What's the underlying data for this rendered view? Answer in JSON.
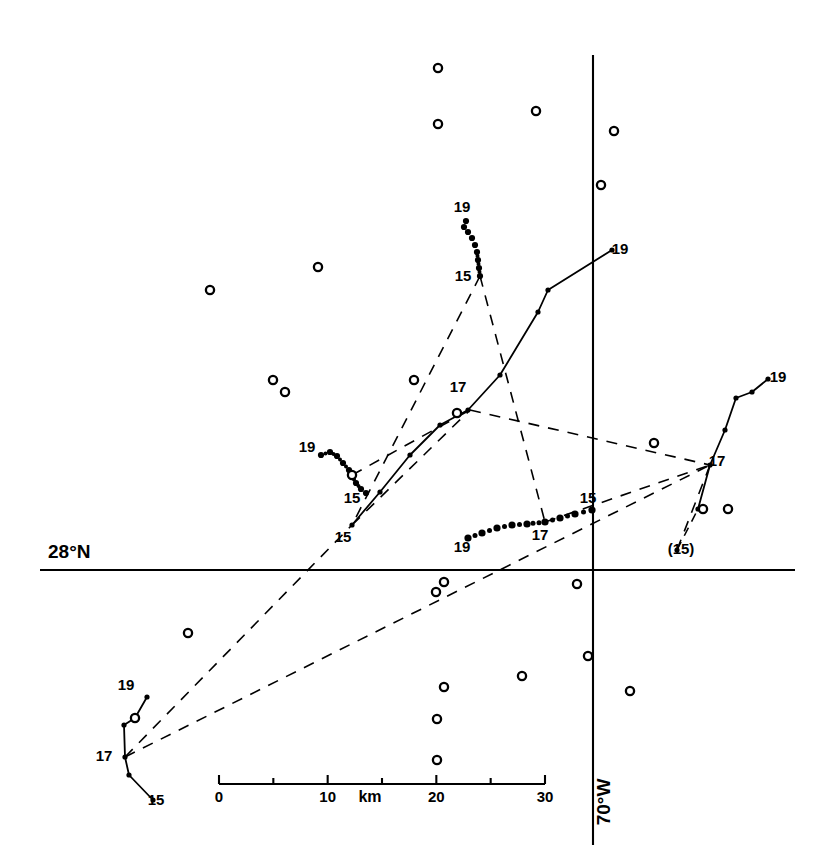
{
  "figure": {
    "type": "map",
    "background_color": "#ffffff",
    "ink_color": "#000000"
  },
  "axes": {
    "latitude_label": "28°N",
    "longitude_label": "70°W",
    "horizontal_axis": {
      "y_px": 570,
      "x_start_px": 40,
      "x_end_px": 795
    },
    "vertical_axis": {
      "x_px": 593,
      "y_start_px": 55,
      "y_end_px": 845
    }
  },
  "scalebar": {
    "unit_label": "km",
    "tick_labels": [
      "0",
      "10",
      "20",
      "30"
    ],
    "tick_values": [
      0,
      5,
      10,
      15,
      20,
      25,
      30
    ],
    "major_ticks": [
      0,
      10,
      20,
      30
    ],
    "x_start_px": 219,
    "x_end_px": 545,
    "y_px": 784,
    "km_per_px": 0.092
  },
  "chart_data": {
    "type": "scatter",
    "title": "",
    "xlabel": "km",
    "ylabel": "",
    "grid": false,
    "legend": "none",
    "station_markers": {
      "symbol": "open-circle",
      "count": 24,
      "points_px": [
        [
          438,
          68
        ],
        [
          438,
          124
        ],
        [
          536,
          111
        ],
        [
          614,
          131
        ],
        [
          601,
          185
        ],
        [
          318,
          267
        ],
        [
          210,
          290
        ],
        [
          273,
          380
        ],
        [
          285,
          392
        ],
        [
          414,
          380
        ],
        [
          457,
          413
        ],
        [
          352,
          475
        ],
        [
          135,
          718
        ],
        [
          188,
          633
        ],
        [
          444,
          582
        ],
        [
          436,
          592
        ],
        [
          654,
          443
        ],
        [
          577,
          584
        ],
        [
          444,
          687
        ],
        [
          437,
          719
        ],
        [
          437,
          760
        ],
        [
          588,
          656
        ],
        [
          522,
          676
        ],
        [
          630,
          691
        ],
        [
          703,
          509
        ],
        [
          728,
          509
        ]
      ]
    },
    "tracks": [
      {
        "id": "track-top-center",
        "style": "dotted",
        "start_label": "15",
        "end_label": "19",
        "labels": [
          {
            "text": "19",
            "x": 462,
            "y": 212
          },
          {
            "text": "15",
            "x": 463,
            "y": 281
          }
        ],
        "points_px": [
          [
            480,
            276
          ],
          [
            479,
            268
          ],
          [
            478,
            260
          ],
          [
            477,
            252
          ],
          [
            475,
            245
          ],
          [
            472,
            238
          ],
          [
            468,
            232
          ],
          [
            464,
            227
          ],
          [
            466,
            221
          ]
        ]
      },
      {
        "id": "track-left-small",
        "style": "dotted",
        "start_label": "19",
        "end_label": "15",
        "labels": [
          {
            "text": "19",
            "x": 307,
            "y": 452
          },
          {
            "text": "15",
            "x": 352,
            "y": 503
          }
        ],
        "points_px": [
          [
            321,
            455
          ],
          [
            330,
            452
          ],
          [
            337,
            456
          ],
          [
            343,
            463
          ],
          [
            349,
            470
          ],
          [
            352,
            476
          ],
          [
            356,
            483
          ],
          [
            361,
            489
          ],
          [
            366,
            493
          ]
        ]
      },
      {
        "id": "track-center-long",
        "style": "solid",
        "start_label": "15",
        "mid_label": "17",
        "end_label": "19",
        "labels": [
          {
            "text": "15",
            "x": 343,
            "y": 542
          },
          {
            "text": "17",
            "x": 458,
            "y": 392
          },
          {
            "text": "19",
            "x": 620,
            "y": 254
          }
        ],
        "points_px": [
          [
            352,
            525
          ],
          [
            380,
            492
          ],
          [
            410,
            455
          ],
          [
            440,
            425
          ],
          [
            468,
            410
          ],
          [
            500,
            375
          ],
          [
            538,
            312
          ],
          [
            548,
            290
          ],
          [
            612,
            250
          ]
        ]
      },
      {
        "id": "track-center-bottom",
        "style": "dotted-heavy",
        "start_label": "19",
        "mid_label": "17",
        "end_label": "15",
        "labels": [
          {
            "text": "19",
            "x": 462,
            "y": 552
          },
          {
            "text": "17",
            "x": 540,
            "y": 540
          },
          {
            "text": "15",
            "x": 588,
            "y": 503
          }
        ],
        "points_px": [
          [
            468,
            538
          ],
          [
            482,
            533
          ],
          [
            497,
            528
          ],
          [
            512,
            525
          ],
          [
            527,
            524
          ],
          [
            545,
            522
          ],
          [
            560,
            518
          ],
          [
            575,
            514
          ],
          [
            592,
            510
          ]
        ]
      },
      {
        "id": "track-right",
        "style": "solid",
        "start_label": "(15)",
        "mid_label": "17",
        "end_label": "19",
        "labels": [
          {
            "text": "(15)",
            "x": 681,
            "y": 554
          },
          {
            "text": "17",
            "x": 717,
            "y": 466
          },
          {
            "text": "19",
            "x": 778,
            "y": 382
          }
        ],
        "points_px": [
          [
            677,
            550
          ],
          [
            698,
            509
          ],
          [
            710,
            465
          ],
          [
            725,
            430
          ],
          [
            736,
            398
          ],
          [
            752,
            392
          ],
          [
            768,
            379
          ]
        ],
        "dashed_from_start": true
      },
      {
        "id": "track-bottom-left",
        "style": "solid",
        "start_label": "15",
        "mid_label": "17",
        "end_label": "19",
        "labels": [
          {
            "text": "19",
            "x": 126,
            "y": 690
          },
          {
            "text": "17",
            "x": 104,
            "y": 761
          },
          {
            "text": "15",
            "x": 156,
            "y": 805
          }
        ],
        "points_px": [
          [
            153,
            800
          ],
          [
            129,
            775
          ],
          [
            125,
            757
          ],
          [
            124,
            725
          ],
          [
            135,
            718
          ],
          [
            147,
            697
          ]
        ]
      }
    ],
    "dashed_network": {
      "description": "Dashed lines linking simultaneous positions of the tracked floats",
      "segments_px": [
        [
          [
            480,
            276
          ],
          [
            352,
            525
          ]
        ],
        [
          [
            480,
            276
          ],
          [
            545,
            522
          ]
        ],
        [
          [
            352,
            525
          ],
          [
            470,
            410
          ]
        ],
        [
          [
            470,
            410
          ],
          [
            710,
            465
          ]
        ],
        [
          [
            545,
            522
          ],
          [
            710,
            465
          ]
        ],
        [
          [
            125,
            757
          ],
          [
            352,
            525
          ]
        ],
        [
          [
            125,
            757
          ],
          [
            710,
            465
          ]
        ],
        [
          [
            677,
            550
          ],
          [
            710,
            465
          ]
        ],
        [
          [
            352,
            475
          ],
          [
            470,
            410
          ]
        ]
      ]
    }
  }
}
